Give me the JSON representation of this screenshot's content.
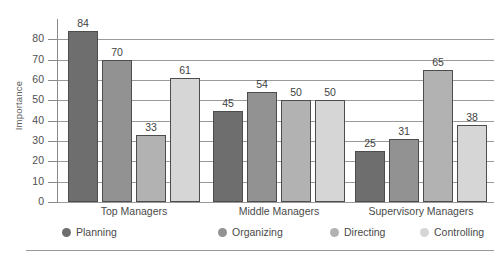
{
  "chart_data": {
    "type": "bar",
    "title": "",
    "xlabel": "",
    "ylabel": "Importance",
    "ylim": [
      0,
      90
    ],
    "ytick_step": 10,
    "yticks": [
      80,
      70,
      60,
      50,
      40,
      30,
      20,
      10,
      0
    ],
    "grid": true,
    "legend_position": "bottom",
    "categories": [
      "Top Managers",
      "Middle Managers",
      "Supervisory Managers"
    ],
    "series": [
      {
        "name": "Planning",
        "color": "#6e6e6e",
        "values": [
          84,
          45,
          25
        ]
      },
      {
        "name": "Organizing",
        "color": "#929292",
        "values": [
          70,
          54,
          31
        ]
      },
      {
        "name": "Directing",
        "color": "#b2b2b2",
        "values": [
          33,
          50,
          65
        ]
      },
      {
        "name": "Controlling",
        "color": "#d6d6d6",
        "values": [
          61,
          50,
          38
        ]
      }
    ]
  },
  "legend": {
    "items": [
      {
        "label": "Planning",
        "marker": "circle-swatch-planning"
      },
      {
        "label": "Organizing",
        "marker": "circle-swatch-organizing"
      },
      {
        "label": "Directing",
        "marker": "circle-swatch-directing"
      },
      {
        "label": "Controlling",
        "marker": "circle-swatch-controlling"
      }
    ]
  },
  "axis": {
    "y_title": "Importance"
  },
  "colors": {
    "gridline": "#9a9a9a",
    "bar_outline": "#4d4d4d",
    "text": "#4a4a4a",
    "rule": "#9a9a9a"
  }
}
